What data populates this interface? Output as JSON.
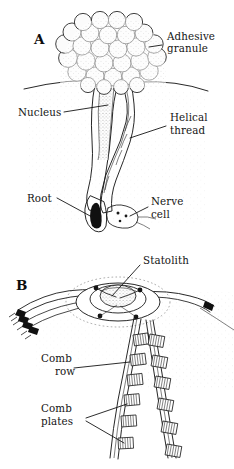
{
  "figure": {
    "background_color": "#ffffff",
    "ink_color": "#1b1b1b"
  },
  "panels": [
    {
      "id": "A",
      "letter": "A",
      "subject": "colloblast",
      "labels": [
        {
          "key": "adhesive_granule",
          "lines": [
            "Adhesive",
            "granule"
          ],
          "align": "left"
        },
        {
          "key": "nucleus",
          "lines": [
            "Nucleus"
          ],
          "align": "left"
        },
        {
          "key": "helical_thread",
          "lines": [
            "Helical",
            "thread"
          ],
          "align": "left"
        },
        {
          "key": "root",
          "lines": [
            "Root"
          ],
          "align": "left"
        },
        {
          "key": "nerve_cell",
          "lines": [
            "Nerve",
            "cell"
          ],
          "align": "left"
        }
      ]
    },
    {
      "id": "B",
      "letter": "B",
      "subject": "statocyst with comb rows",
      "labels": [
        {
          "key": "statolith",
          "lines": [
            "Statolith"
          ],
          "align": "left"
        },
        {
          "key": "comb_row",
          "lines": [
            "Comb",
            "row"
          ],
          "align": "right"
        },
        {
          "key": "comb_plates",
          "lines": [
            "Comb",
            "plates"
          ],
          "align": "left"
        }
      ]
    }
  ],
  "text": {
    "panel_a_letter": "A",
    "panel_b_letter": "B",
    "adhesive_line1": "Adhesive",
    "adhesive_line2": "granule",
    "nucleus": "Nucleus",
    "helical_line1": "Helical",
    "helical_line2": "thread",
    "root": "Root",
    "nerve_line1": "Nerve",
    "nerve_line2": "cell",
    "statolith": "Statolith",
    "comb_row_line1": "Comb",
    "comb_row_line2": "row",
    "comb_plates_line1": "Comb",
    "comb_plates_line2": "plates"
  }
}
